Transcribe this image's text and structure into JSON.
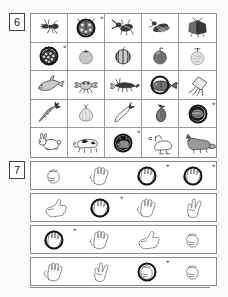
{
  "page": {
    "background_color": "#fbfbfb",
    "ink_color": "#2b2b2b",
    "border_color": "#8a8a8a",
    "circle_mark_color": "#111111"
  },
  "sections": [
    {
      "number": "6",
      "type": "picture-grid",
      "columns": 5,
      "rows": 5,
      "cells": [
        {
          "label": "ant",
          "icon": "ant-icon",
          "circled": false
        },
        {
          "label": "ladybug",
          "icon": "ladybug-icon",
          "circled": true,
          "mark": "※"
        },
        {
          "label": "stag beetle",
          "icon": "stag-beetle-icon",
          "circled": false
        },
        {
          "label": "cicada",
          "icon": "cicada-icon",
          "circled": false
        },
        {
          "label": "moth",
          "icon": "moth-icon",
          "circled": false
        },
        {
          "label": "strawberry",
          "icon": "strawberry-icon",
          "circled": true,
          "mark": "※"
        },
        {
          "label": "persimmon",
          "icon": "persimmon-icon",
          "circled": false
        },
        {
          "label": "watermelon",
          "icon": "watermelon-icon",
          "circled": false
        },
        {
          "label": "apple",
          "icon": "apple-icon",
          "circled": false
        },
        {
          "label": "melon",
          "icon": "melon-icon",
          "circled": false
        },
        {
          "label": "dolphin",
          "icon": "dolphin-icon",
          "circled": false
        },
        {
          "label": "crab",
          "icon": "crab-icon",
          "circled": false
        },
        {
          "label": "lobster",
          "icon": "lobster-icon",
          "circled": false
        },
        {
          "label": "fish",
          "icon": "fish-icon",
          "circled": true,
          "mark": ""
        },
        {
          "label": "squid",
          "icon": "squid-icon",
          "circled": false
        },
        {
          "label": "carrot",
          "icon": "carrot-icon",
          "circled": false
        },
        {
          "label": "onion",
          "icon": "onion-icon",
          "circled": false
        },
        {
          "label": "daikon radish",
          "icon": "daikon-icon",
          "circled": false
        },
        {
          "label": "eggplant",
          "icon": "eggplant-icon",
          "circled": false
        },
        {
          "label": "cabbage",
          "icon": "cabbage-icon",
          "circled": true,
          "mark": "※"
        },
        {
          "label": "rabbit",
          "icon": "rabbit-icon",
          "circled": false
        },
        {
          "label": "cow",
          "icon": "cow-icon",
          "circled": false
        },
        {
          "label": "pig",
          "icon": "pig-icon",
          "circled": true,
          "mark": "※"
        },
        {
          "label": "duck",
          "icon": "duck-icon",
          "circled": false
        },
        {
          "label": "fox",
          "icon": "fox-icon",
          "circled": false
        }
      ]
    },
    {
      "number": "7",
      "type": "hand-gesture-rows",
      "columns": 4,
      "rows": [
        {
          "cells": [
            {
              "label": "fist",
              "icon": "hand-fist-icon",
              "circled": false
            },
            {
              "label": "open palm five fingers",
              "icon": "hand-open-palm-icon",
              "circled": false
            },
            {
              "label": "open palm five fingers",
              "icon": "hand-open-palm-icon",
              "circled": true,
              "mark": "※"
            },
            {
              "label": "open palm five fingers",
              "icon": "hand-open-palm-icon",
              "circled": true,
              "mark": "※"
            }
          ]
        },
        {
          "cells": [
            {
              "label": "thumbs up",
              "icon": "hand-thumbs-up-icon",
              "circled": false
            },
            {
              "label": "open palm five fingers",
              "icon": "hand-open-palm-icon",
              "circled": true,
              "mark": "※"
            },
            {
              "label": "open palm five fingers",
              "icon": "hand-open-palm-icon",
              "circled": false
            },
            {
              "label": "peace sign two fingers",
              "icon": "hand-peace-icon",
              "circled": false
            }
          ]
        },
        {
          "cells": [
            {
              "label": "open palm five fingers",
              "icon": "hand-open-palm-icon",
              "circled": true,
              "mark": "※"
            },
            {
              "label": "open palm five fingers",
              "icon": "hand-open-palm-icon",
              "circled": false
            },
            {
              "label": "thumbs up",
              "icon": "hand-thumbs-up-icon",
              "circled": false
            },
            {
              "label": "fist",
              "icon": "hand-fist-icon",
              "circled": false
            }
          ]
        },
        {
          "cells": [
            {
              "label": "open palm five fingers",
              "icon": "hand-open-palm-icon",
              "circled": false
            },
            {
              "label": "peace sign two fingers",
              "icon": "hand-peace-icon",
              "circled": false
            },
            {
              "label": "fist",
              "icon": "hand-fist-icon",
              "circled": true,
              "mark": "※"
            },
            {
              "label": "fist",
              "icon": "hand-fist-icon",
              "circled": false
            }
          ]
        }
      ]
    }
  ]
}
